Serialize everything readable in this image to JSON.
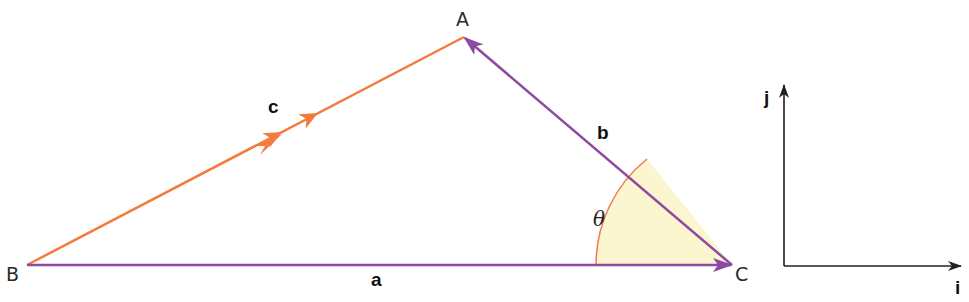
{
  "diagram": {
    "type": "vector-triangle",
    "colors": {
      "vector_c": "#f47a3e",
      "vector_a": "#8e4aa0",
      "vector_b": "#8e4aa0",
      "angle_fill": "#fbf6cf",
      "angle_arc": "#f07a50",
      "axes": "#222222",
      "text": "#222222"
    },
    "vertices": {
      "A": {
        "label": "A",
        "x": 464,
        "y": 37
      },
      "B": {
        "label": "B",
        "x": 27,
        "y": 265
      },
      "C": {
        "label": "C",
        "x": 732,
        "y": 265
      }
    },
    "vectors": [
      {
        "name": "a",
        "label": "a",
        "from": "B",
        "to": "C",
        "color": "#8e4aa0"
      },
      {
        "name": "b",
        "label": "b",
        "from": "C",
        "to": "A",
        "color": "#8e4aa0"
      },
      {
        "name": "c",
        "label": "c",
        "from": "B",
        "to": "A",
        "color": "#f47a3e",
        "double_arrow": true
      }
    ],
    "angle": {
      "label": "θ",
      "at": "C",
      "between": [
        "a",
        "b"
      ]
    },
    "basis_axes": {
      "i_label": "i",
      "j_label": "j"
    }
  }
}
